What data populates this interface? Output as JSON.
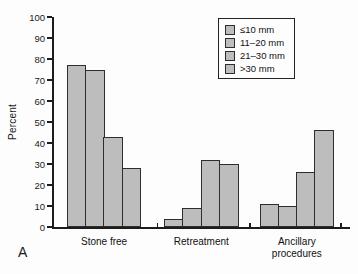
{
  "panel_label": "A",
  "colors": {
    "bar_fill": "#bdbdbd",
    "bar_border": "#2e2e2e",
    "axis": "#1c1c1c",
    "background": "#fdfdfd",
    "text": "#1a1a1a"
  },
  "chart_data": {
    "type": "bar",
    "title": "",
    "xlabel": "",
    "ylabel": "Percent",
    "ylim": [
      0,
      100
    ],
    "yticks": [
      0,
      10,
      20,
      30,
      40,
      50,
      60,
      70,
      80,
      90,
      100
    ],
    "grid": false,
    "legend_position": "top-right-inside",
    "categories": [
      "Stone free",
      "Retreatment",
      "Ancillary procedures"
    ],
    "series": [
      {
        "name": "≤10 mm",
        "values": [
          77,
          4,
          11
        ]
      },
      {
        "name": "11–20 mm",
        "values": [
          75,
          9,
          10
        ]
      },
      {
        "name": "21–30 mm",
        "values": [
          43,
          32,
          26
        ]
      },
      {
        "name": ">30 mm",
        "values": [
          28,
          30,
          46
        ]
      }
    ]
  }
}
